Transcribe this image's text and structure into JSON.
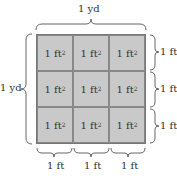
{
  "diagram": {
    "top_label": "1 yd",
    "left_label": "1 yd",
    "right_labels": [
      "1 ft",
      "1 ft",
      "1 ft"
    ],
    "bottom_labels": [
      "1 ft",
      "1 ft",
      "1 ft"
    ],
    "cells": [
      {
        "text": "1 ft",
        "exp": "2"
      },
      {
        "text": "1 ft",
        "exp": "2"
      },
      {
        "text": "1 ft",
        "exp": "2"
      },
      {
        "text": "1 ft",
        "exp": "2"
      },
      {
        "text": "1 ft",
        "exp": "2"
      },
      {
        "text": "1 ft",
        "exp": "2"
      },
      {
        "text": "1 ft",
        "exp": "2"
      },
      {
        "text": "1 ft",
        "exp": "2"
      },
      {
        "text": "1 ft",
        "exp": "2"
      }
    ],
    "colors": {
      "fill": "#c9c9c9",
      "lines": "#777777",
      "text": "#333333"
    }
  }
}
